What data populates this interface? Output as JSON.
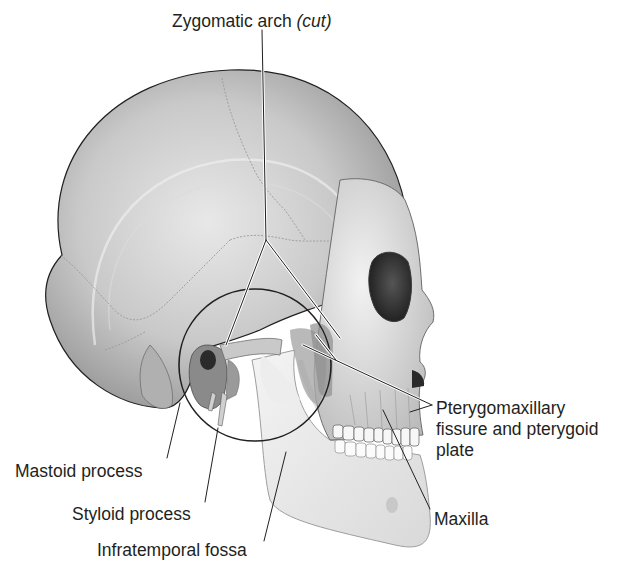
{
  "figure": {
    "colors": {
      "background": "#ffffff",
      "bone_light": "#e6e6e6",
      "bone_mid": "#bdbdbd",
      "bone_dark": "#7a7a7a",
      "outline": "#231f20",
      "text": "#231f20"
    }
  },
  "labels": {
    "zygomatic_arch": {
      "text": "Zygomatic arch",
      "qualifier": "(cut)"
    },
    "pterygomaxillary": {
      "lines": [
        "Pterygomaxillary",
        "fissure and pterygoid",
        "plate"
      ]
    },
    "maxilla": {
      "text": "Maxilla"
    },
    "mastoid": {
      "text": "Mastoid process"
    },
    "styloid": {
      "text": "Styloid process"
    },
    "infratemporal": {
      "text": "Infratemporal fossa"
    }
  }
}
